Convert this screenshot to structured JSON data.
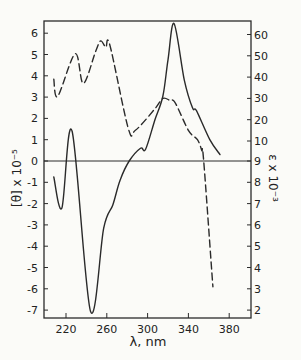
{
  "chart_data": {
    "type": "line",
    "title": "",
    "xlabel": "λ, nm",
    "ylabel_left": "[θ] x 10⁻⁵",
    "ylabel_right": "ε x 10⁻³",
    "xlim": [
      208,
      385
    ],
    "ylim_left": [
      -7.5,
      6.6
    ],
    "x_ticks": [
      220,
      260,
      300,
      340,
      380
    ],
    "y_left_ticks": [
      6,
      5,
      4,
      3,
      2,
      1,
      0,
      -1,
      -2,
      -3,
      -4,
      -5,
      -6,
      -7
    ],
    "y_right_ticks": [
      60,
      50,
      40,
      30,
      20,
      10,
      9,
      8,
      7,
      6,
      5,
      4,
      3,
      2
    ],
    "y_right_note": "Right axis is broken: 10–60 in steps of 10 occupy the upper part, 2–9 in steps of 1 occupy the lower part, each step aligned with one left-axis unit",
    "grid": false,
    "zero_line": true,
    "legend": null,
    "series": [
      {
        "name": "CD [θ] x 10⁻⁵",
        "axis": "left",
        "style": "solid",
        "x": [
          208,
          216,
          226,
          244,
          257,
          266,
          273,
          282,
          293,
          298,
          307,
          315,
          320,
          326,
          336,
          344,
          348,
          361,
          371
        ],
        "y": [
          -0.75,
          -2.2,
          1.4,
          -7.05,
          -3.15,
          -2.05,
          -0.9,
          0,
          0.6,
          0.55,
          1.9,
          3.05,
          4.75,
          6.45,
          3.8,
          2.5,
          2.35,
          1.0,
          0.3
        ]
      },
      {
        "name": "Absorption ε x 10⁻³",
        "axis": "right",
        "style": "dashed",
        "x": [
          208,
          212,
          229,
          237,
          249,
          254,
          259,
          263,
          281,
          288,
          307,
          315,
          322,
          327,
          340,
          349,
          353,
          355,
          364
        ],
        "y": [
          39,
          31,
          51,
          37,
          52,
          57,
          54,
          55,
          16,
          15,
          25,
          30,
          29,
          28,
          15,
          10.5,
          9.5,
          9,
          3.1
        ]
      }
    ]
  }
}
